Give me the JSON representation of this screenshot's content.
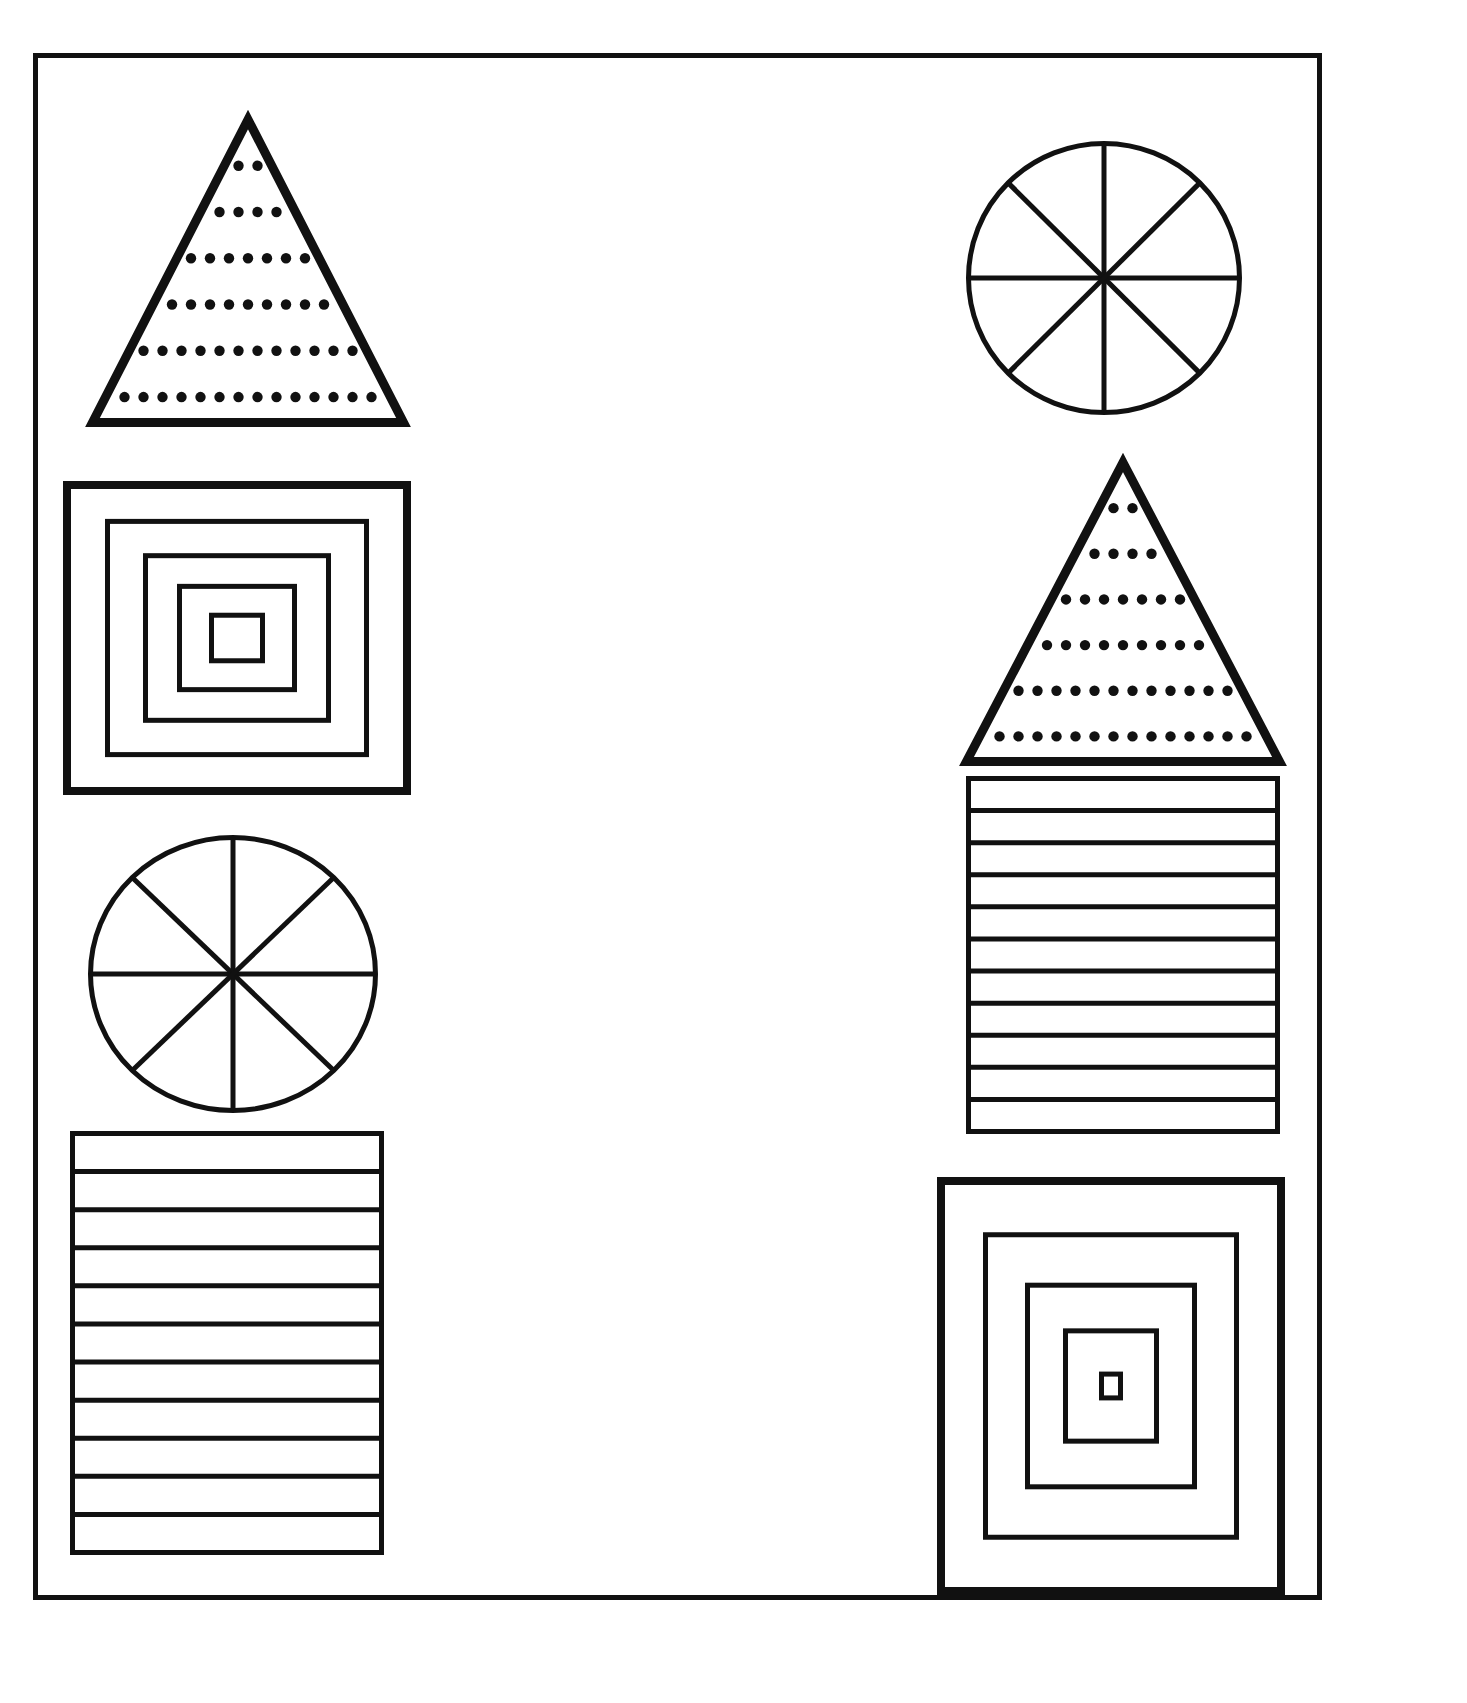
{
  "page": {
    "background_color": "#ffffff",
    "ink_color": "#111111",
    "width": 1467,
    "height": 1703
  },
  "sheet": {
    "border_color": "#111111",
    "border_width": 5,
    "x": 33,
    "y": 53,
    "width": 1289,
    "height": 1547
  },
  "columns": [
    {
      "name": "left-column",
      "shapes": [
        {
          "id": "left-dotted-triangle",
          "kind": "dotted-triangle",
          "label": "Triangle with dotted horizontal rows",
          "x": 88,
          "y": 115,
          "width": 320,
          "height": 312,
          "stroke_width": 9,
          "dot_rows": 6,
          "dot_radius": 5.2,
          "dot_spacing": 19
        },
        {
          "id": "left-nested-squares",
          "kind": "nested-squares",
          "label": "Five concentric squares",
          "x": 63,
          "y": 481,
          "width": 348,
          "height": 314,
          "levels": 5,
          "stroke_widths": [
            8,
            5,
            5,
            5,
            5
          ],
          "inset_steps": [
            42,
            38,
            34,
            32
          ]
        },
        {
          "id": "left-spoked-circle",
          "kind": "spoked-circle",
          "label": "Circle divided into eight sectors",
          "x": 88,
          "y": 835,
          "width": 290,
          "height": 278,
          "stroke_width": 5,
          "sectors": 8,
          "diameters": 4
        },
        {
          "id": "left-striped-rectangle",
          "kind": "striped-rectangle",
          "label": "Rectangle with eleven horizontal bands",
          "x": 70,
          "y": 1131,
          "width": 314,
          "height": 424,
          "stroke_width": 5,
          "bands": 11
        }
      ]
    },
    {
      "name": "right-column",
      "shapes": [
        {
          "id": "right-spoked-circle",
          "kind": "spoked-circle",
          "label": "Circle divided into eight sectors",
          "x": 966,
          "y": 141,
          "width": 276,
          "height": 274,
          "stroke_width": 5,
          "sectors": 8,
          "diameters": 4
        },
        {
          "id": "right-dotted-triangle",
          "kind": "dotted-triangle",
          "label": "Triangle with dotted horizontal rows",
          "x": 962,
          "y": 458,
          "width": 322,
          "height": 308,
          "stroke_width": 9,
          "dot_rows": 6,
          "dot_radius": 5.2,
          "dot_spacing": 19
        },
        {
          "id": "right-striped-rectangle",
          "kind": "striped-rectangle",
          "label": "Rectangle with eleven horizontal bands",
          "x": 966,
          "y": 776,
          "width": 314,
          "height": 358,
          "stroke_width": 5,
          "bands": 11
        },
        {
          "id": "right-nested-squares",
          "kind": "nested-squares",
          "label": "Five concentric squares",
          "x": 937,
          "y": 1177,
          "width": 348,
          "height": 418,
          "levels": 5,
          "stroke_widths": [
            8,
            5,
            5,
            5,
            5
          ],
          "inset_steps": [
            46,
            42,
            38,
            36
          ]
        }
      ]
    }
  ]
}
